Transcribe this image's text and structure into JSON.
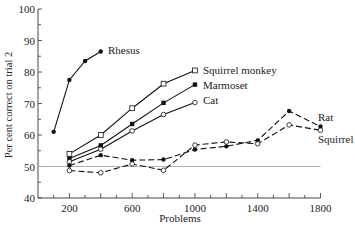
{
  "chart_data": {
    "type": "line",
    "title": "",
    "xlabel": "Problems",
    "ylabel": "Per cent correct on trial 2",
    "xlim": [
      0,
      1800
    ],
    "ylim": [
      40,
      100
    ],
    "x_ticks": [
      200,
      600,
      1000,
      1400,
      1800
    ],
    "x_tick_labels": [
      "200",
      "600",
      "1000",
      "1400",
      "1800"
    ],
    "y_ticks": [
      40,
      50,
      60,
      70,
      80,
      90,
      100
    ],
    "y_tick_labels": [
      "40",
      "50",
      "60",
      "70",
      "80",
      "90",
      "100"
    ],
    "reference_line": {
      "y": 50,
      "color": "#aaaaaa"
    },
    "grid": false,
    "legend_position": "inline labels at line ends",
    "series": [
      {
        "name": "Rhesus",
        "marker": "filled-circle",
        "dash": false,
        "x": [
          100,
          200,
          300,
          400
        ],
        "values": [
          61,
          77.5,
          83.5,
          86.5
        ],
        "label_pos": [
          108,
          54
        ]
      },
      {
        "name": "Squirrel monkey",
        "marker": "open-square",
        "dash": false,
        "x": [
          200,
          400,
          600,
          800,
          1000
        ],
        "values": [
          54,
          60,
          68.5,
          76.3,
          80.5
        ],
        "label_pos": [
          203,
          74
        ]
      },
      {
        "name": "Marmoset",
        "marker": "filled-square",
        "dash": false,
        "x": [
          200,
          400,
          600,
          800,
          1000
        ],
        "values": [
          52.5,
          56.7,
          63.5,
          70.2,
          76
        ],
        "label_pos": [
          203,
          89
        ]
      },
      {
        "name": "Cat",
        "marker": "open-circle",
        "dash": false,
        "x": [
          200,
          400,
          600,
          800,
          1000
        ],
        "values": [
          51.5,
          55.5,
          61.3,
          66.5,
          70.3
        ],
        "label_pos": [
          203,
          104
        ]
      },
      {
        "name": "Rat",
        "marker": "filled-circle",
        "dash": true,
        "x": [
          200,
          400,
          600,
          800,
          1000,
          1200,
          1400,
          1600,
          1800
        ],
        "values": [
          50.3,
          53.6,
          52,
          52.2,
          55.4,
          56.4,
          58.3,
          67.6,
          62.7
        ],
        "label_pos": [
          318,
          121
        ]
      },
      {
        "name": "Squirrel",
        "marker": "open-circle",
        "dash": true,
        "x": [
          200,
          400,
          600,
          800,
          1000,
          1200,
          1400,
          1600,
          1800
        ],
        "values": [
          48.7,
          48,
          50.8,
          48.8,
          56.8,
          57.8,
          57.2,
          63.2,
          61.5
        ],
        "label_pos": [
          318,
          143
        ]
      }
    ]
  }
}
